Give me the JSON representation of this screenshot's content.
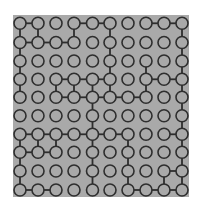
{
  "puzzle": {
    "rows": 10,
    "cols": 10,
    "colors": {
      "background": "#a9a9a9",
      "stroke": "#2e2e2e",
      "page": "#ffffff"
    },
    "col_x": [
      20,
      38,
      56,
      74,
      92.5,
      110,
      128,
      146,
      164,
      182
    ],
    "row_y": [
      23.3,
      42.5,
      61,
      79.3,
      97.3,
      115.7,
      134.3,
      152.3,
      171,
      190
    ],
    "horizontal_edges": [
      [
        0,
        0
      ],
      [
        0,
        3
      ],
      [
        0,
        4
      ],
      [
        0,
        7
      ],
      [
        0,
        8
      ],
      [
        1,
        0
      ],
      [
        1,
        1
      ],
      [
        1,
        2
      ],
      [
        3,
        2
      ],
      [
        3,
        3
      ],
      [
        3,
        4
      ],
      [
        3,
        7
      ],
      [
        3,
        8
      ],
      [
        4,
        2
      ],
      [
        4,
        3
      ],
      [
        4,
        4
      ],
      [
        4,
        5
      ],
      [
        4,
        6
      ],
      [
        6,
        0
      ],
      [
        6,
        1
      ],
      [
        6,
        2
      ],
      [
        6,
        3
      ],
      [
        6,
        4
      ],
      [
        6,
        5
      ],
      [
        6,
        8
      ],
      [
        7,
        0
      ],
      [
        7,
        1
      ],
      [
        8,
        8
      ],
      [
        9,
        0
      ],
      [
        9,
        1
      ],
      [
        9,
        6
      ],
      [
        9,
        7
      ],
      [
        9,
        8
      ]
    ],
    "vertical_edges": [
      [
        0,
        0
      ],
      [
        1,
        0
      ],
      [
        2,
        0
      ],
      [
        3,
        0
      ],
      [
        6,
        0
      ],
      [
        7,
        0
      ],
      [
        8,
        0
      ],
      [
        0,
        1
      ],
      [
        6,
        1
      ],
      [
        3,
        2
      ],
      [
        6,
        2
      ],
      [
        0,
        3
      ],
      [
        3,
        3
      ],
      [
        3,
        4
      ],
      [
        4,
        4
      ],
      [
        5,
        4
      ],
      [
        6,
        4
      ],
      [
        7,
        4
      ],
      [
        8,
        4
      ],
      [
        0,
        5
      ],
      [
        1,
        5
      ],
      [
        2,
        5
      ],
      [
        3,
        5
      ],
      [
        6,
        6
      ],
      [
        7,
        6
      ],
      [
        8,
        6
      ],
      [
        2,
        7
      ],
      [
        3,
        7
      ],
      [
        8,
        8
      ],
      [
        0,
        9
      ],
      [
        1,
        9
      ],
      [
        2,
        9
      ],
      [
        3,
        9
      ],
      [
        4,
        9
      ],
      [
        5,
        9
      ],
      [
        6,
        9
      ],
      [
        7,
        9
      ],
      [
        8,
        9
      ]
    ]
  }
}
